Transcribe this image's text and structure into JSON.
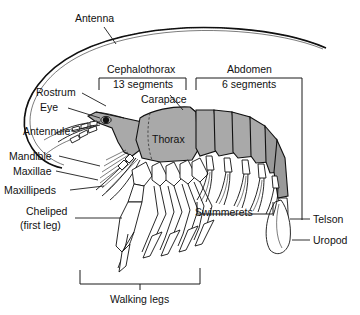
{
  "figure": {
    "background_color": "#ffffff",
    "body_fill_color": "#a9a9a9",
    "outline_color": "#111111"
  },
  "labels": {
    "antenna": "Antenna",
    "rostrum": "Rostrum",
    "eye": "Eye",
    "antennule": "Antennule",
    "mandible": "Mandible",
    "maxillae": "Maxillae",
    "maxillipeds": "Maxillipeds",
    "cheliped_line1": "Cheliped",
    "cheliped_line2": "(first leg)",
    "walking_legs": "Walking legs",
    "cephalothorax_line1": "Cephalothorax",
    "cephalothorax_line2": "13 segments",
    "abdomen_line1": "Abdomen",
    "abdomen_line2": "6 segments",
    "carapace": "Carapace",
    "thorax": "Thorax",
    "swimmerets": "Swimmerets",
    "telson": "Telson",
    "uropod": "Uropod"
  },
  "regions": {
    "cephalothorax_segments": "13 segments",
    "abdomen_segments": "6 segments"
  }
}
